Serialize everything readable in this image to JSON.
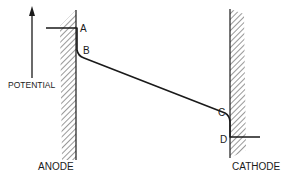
{
  "diagram": {
    "type": "potential-profile",
    "axis_label": "POTENTIAL",
    "electrodes": {
      "left": "ANODE",
      "right": "CATHODE"
    },
    "points": {
      "A": "A",
      "B": "B",
      "C": "C",
      "D": "D"
    },
    "colors": {
      "line": "#1a1a1a",
      "background": "#ffffff"
    }
  }
}
